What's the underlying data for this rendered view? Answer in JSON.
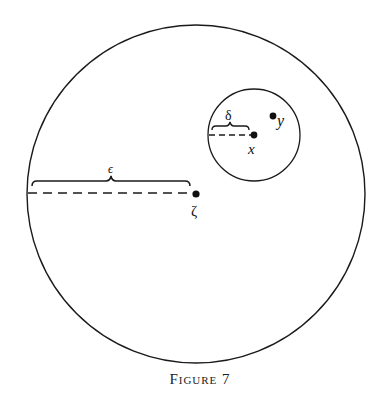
{
  "figure": {
    "caption": "Figure 7",
    "colors": {
      "stroke": "#1a1a1a",
      "background": "#ffffff"
    }
  },
  "labels": {
    "epsilon": "ϵ",
    "delta": "δ",
    "zeta": "ζ",
    "x": "x",
    "y": "y"
  },
  "geometry": {
    "outer_circle": {
      "cx": 196,
      "cy": 194,
      "r": 169
    },
    "inner_circle": {
      "cx": 254,
      "cy": 135,
      "r": 46
    },
    "points": {
      "zeta": {
        "cx": 196,
        "cy": 194
      },
      "x": {
        "cx": 254,
        "cy": 135
      },
      "y": {
        "cx": 273,
        "cy": 116
      }
    }
  }
}
